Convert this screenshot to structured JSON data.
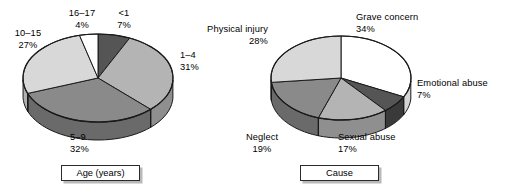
{
  "figure": {
    "background": "#ffffff",
    "outline_color": "#1a1a1a"
  },
  "charts": [
    {
      "id": "age-pie",
      "caption": "Age (years)",
      "chart_data": {
        "type": "pie",
        "title": "Age (years)",
        "xlabel": "",
        "ylabel": "",
        "legend_position": "callout-labels",
        "grid": false,
        "three_d": true,
        "start_angle_deg": -90,
        "direction": "clockwise",
        "categories": [
          "<1",
          "1–4",
          "5–9",
          "10–15",
          "16–17"
        ],
        "values": [
          7,
          31,
          32,
          27,
          4
        ],
        "unit": "%",
        "colors": [
          "#555555",
          "#b4b4b4",
          "#8a8a8a",
          "#d8d8d8",
          "#ffffff"
        ],
        "side_colors": [
          "#3a3a3a",
          "#8f8f8f",
          "#6a6a6a",
          "#b0b0b0",
          "#d4d4d4"
        ],
        "labels": [
          {
            "name": "<1",
            "pct": "7%"
          },
          {
            "name": "1–4",
            "pct": "31%"
          },
          {
            "name": "5–9",
            "pct": "32%"
          },
          {
            "name": "10–15",
            "pct": "27%"
          },
          {
            "name": "16–17",
            "pct": "4%"
          }
        ]
      }
    },
    {
      "id": "cause-pie",
      "caption": "Cause",
      "chart_data": {
        "type": "pie",
        "title": "Cause",
        "xlabel": "",
        "ylabel": "",
        "legend_position": "callout-labels",
        "grid": false,
        "three_d": true,
        "start_angle_deg": -90,
        "direction": "clockwise",
        "categories": [
          "Grave concern",
          "Emotional abuse",
          "Sexual abuse",
          "Neglect",
          "Physical injury"
        ],
        "values": [
          34,
          7,
          17,
          19,
          28
        ],
        "unit": "%",
        "colors": [
          "#ffffff",
          "#555555",
          "#b4b4b4",
          "#8a8a8a",
          "#d8d8d8"
        ],
        "side_colors": [
          "#d4d4d4",
          "#3a3a3a",
          "#8f8f8f",
          "#6a6a6a",
          "#b0b0b0"
        ],
        "labels": [
          {
            "name": "Grave concern",
            "pct": "34%"
          },
          {
            "name": "Emotional abuse",
            "pct": "7%"
          },
          {
            "name": "Sexual abuse",
            "pct": "17%"
          },
          {
            "name": "Neglect",
            "pct": "19%"
          },
          {
            "name": "Physical injury",
            "pct": "28%"
          }
        ]
      }
    }
  ]
}
